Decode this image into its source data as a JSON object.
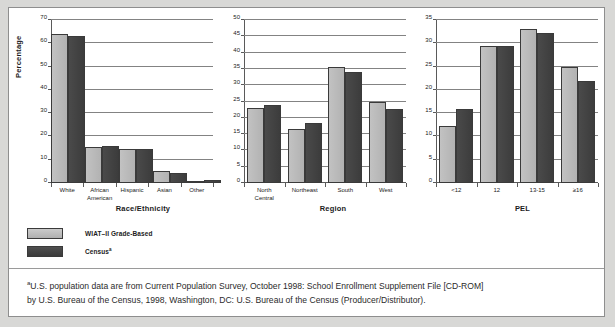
{
  "figure": {
    "legend": [
      {
        "label": "WIAT–II Grade-Based",
        "swatch": "light",
        "color": "#bcbcbc"
      },
      {
        "label": "Census",
        "marker": "a",
        "swatch": "dark",
        "color": "#434343"
      }
    ],
    "footnote": {
      "marker": "a",
      "line1": "U.S. population data are from Current Population Survey, October 1998: School Enrollment Supplement File [CD-ROM]",
      "line2": "by U.S. Bureau of the Census, 1998, Washington, DC: U.S. Bureau of the Census (Producer/Distributor)."
    }
  },
  "chart_data": [
    {
      "type": "bar",
      "id": "race",
      "title": "",
      "xlabel": "Race/Ethnicity",
      "ylabel": "Percentage",
      "ylim": [
        0,
        70
      ],
      "yticks": [
        0,
        10,
        20,
        30,
        40,
        50,
        60,
        70
      ],
      "grid": true,
      "legend_position": "below-left",
      "categories": [
        "White",
        "African American",
        "Hispanic",
        "Asian",
        "Other"
      ],
      "series": [
        {
          "name": "WIAT–II Grade-Based",
          "values": [
            64.0,
            15.6,
            14.7,
            5.0,
            0.9
          ]
        },
        {
          "name": "Census",
          "values": [
            63.0,
            16.0,
            14.7,
            4.3,
            1.3
          ]
        }
      ]
    },
    {
      "type": "bar",
      "id": "region",
      "title": "",
      "xlabel": "Region",
      "ylabel": "",
      "ylim": [
        0,
        50
      ],
      "yticks": [
        0,
        5,
        10,
        15,
        20,
        25,
        30,
        35,
        40,
        45,
        50
      ],
      "grid": true,
      "categories": [
        "North Central",
        "Northeast",
        "South",
        "West"
      ],
      "series": [
        {
          "name": "WIAT–II Grade-Based",
          "values": [
            23.0,
            16.5,
            35.6,
            24.8
          ]
        },
        {
          "name": "Census",
          "values": [
            23.8,
            18.3,
            34.2,
            22.8
          ]
        }
      ]
    },
    {
      "type": "bar",
      "id": "pel",
      "title": "",
      "xlabel": "PEL",
      "ylabel": "",
      "ylim": [
        0,
        35
      ],
      "yticks": [
        0,
        5,
        10,
        15,
        20,
        25,
        30,
        35
      ],
      "grid": true,
      "categories": [
        "<12",
        "12",
        "13-15",
        "≥16"
      ],
      "series": [
        {
          "name": "WIAT–II Grade-Based",
          "values": [
            12.3,
            29.5,
            33.0,
            24.9
          ]
        },
        {
          "name": "Census",
          "values": [
            16.0,
            29.5,
            32.2,
            22.0
          ]
        }
      ]
    }
  ]
}
